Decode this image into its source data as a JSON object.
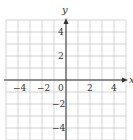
{
  "chart_data": {
    "type": "line",
    "title": "",
    "xlabel": "x",
    "ylabel": "y",
    "xlim": [
      -5,
      5
    ],
    "ylim": [
      -5,
      5
    ],
    "grid": true,
    "grid_step": 1,
    "x_ticks": [
      "-4",
      "-2",
      "0",
      "2",
      "4"
    ],
    "y_ticks": [
      "4",
      "2",
      "-2",
      "-4"
    ],
    "series": []
  },
  "axes": {
    "x_label": "x",
    "y_label": "y",
    "x_tick_labels": [
      "−4",
      "−2",
      "0",
      "2",
      "4"
    ],
    "y_tick_labels": [
      "4",
      "2",
      "−2",
      "−4"
    ]
  },
  "colors": {
    "grid": "#c8c8c8",
    "axis": "#333333",
    "background": "#ffffff"
  }
}
